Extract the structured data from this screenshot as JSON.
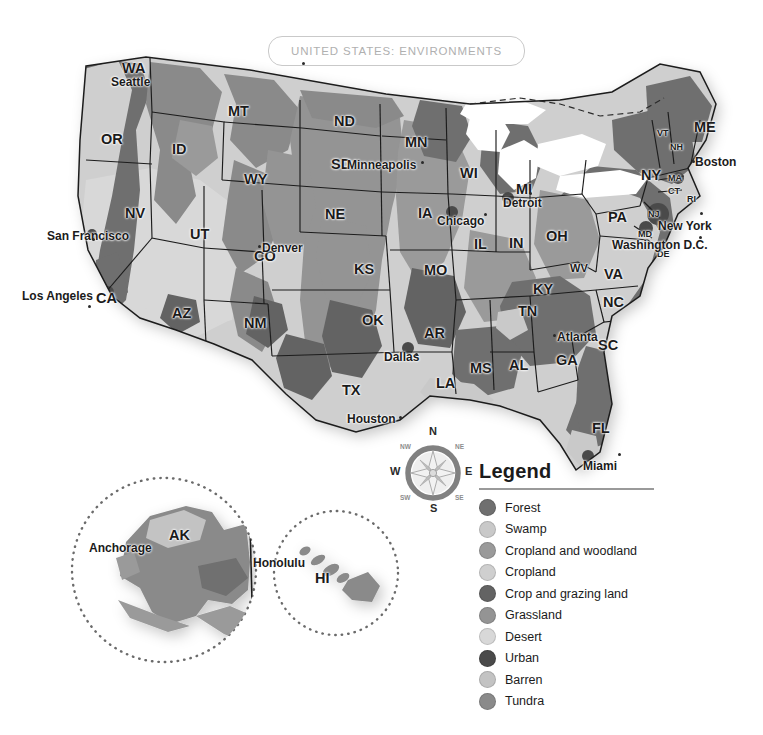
{
  "title": {
    "text": "UNITED STATES: ENVIRONMENTS"
  },
  "legend": {
    "heading": "Legend",
    "items": [
      {
        "label": "Forest",
        "color": "#6f6f6f"
      },
      {
        "label": "Swamp",
        "color": "#c9c9c9"
      },
      {
        "label": "Cropland and woodland",
        "color": "#9a9a9a"
      },
      {
        "label": "Cropland",
        "color": "#cfcfcf"
      },
      {
        "label": "Crop and grazing land",
        "color": "#636363"
      },
      {
        "label": "Grassland",
        "color": "#949494"
      },
      {
        "label": "Desert",
        "color": "#d8d8d8"
      },
      {
        "label": "Urban",
        "color": "#4a4a4a"
      },
      {
        "label": "Barren",
        "color": "#c3c3c3"
      },
      {
        "label": "Tundra",
        "color": "#8a8a8a"
      }
    ]
  },
  "compass": {
    "north": "N",
    "south": "S",
    "east": "E",
    "west": "W",
    "northwest": "NW",
    "northeast": "NE",
    "southwest": "SW",
    "southeast": "SE"
  },
  "insets": {
    "alaska": {
      "state": "AK",
      "city": "Anchorage"
    },
    "hawaii": {
      "state": "HI",
      "city": "Honolulu"
    }
  },
  "map": {
    "states": [
      {
        "abbr": "WA",
        "x": 122,
        "y": 60,
        "size": ""
      },
      {
        "abbr": "OR",
        "x": 101,
        "y": 131,
        "size": ""
      },
      {
        "abbr": "ID",
        "x": 172,
        "y": 141,
        "size": ""
      },
      {
        "abbr": "MT",
        "x": 228,
        "y": 103,
        "size": ""
      },
      {
        "abbr": "WY",
        "x": 244,
        "y": 171,
        "size": ""
      },
      {
        "abbr": "NV",
        "x": 125,
        "y": 205,
        "size": ""
      },
      {
        "abbr": "UT",
        "x": 190,
        "y": 226,
        "size": ""
      },
      {
        "abbr": "CA",
        "x": 96,
        "y": 290,
        "size": ""
      },
      {
        "abbr": "AZ",
        "x": 172,
        "y": 305,
        "size": ""
      },
      {
        "abbr": "CO",
        "x": 254,
        "y": 248,
        "size": ""
      },
      {
        "abbr": "NM",
        "x": 244,
        "y": 315,
        "size": ""
      },
      {
        "abbr": "ND",
        "x": 334,
        "y": 113,
        "size": ""
      },
      {
        "abbr": "SD",
        "x": 331,
        "y": 156,
        "size": ""
      },
      {
        "abbr": "NE",
        "x": 325,
        "y": 206,
        "size": ""
      },
      {
        "abbr": "KS",
        "x": 354,
        "y": 261,
        "size": ""
      },
      {
        "abbr": "OK",
        "x": 362,
        "y": 312,
        "size": ""
      },
      {
        "abbr": "TX",
        "x": 342,
        "y": 382,
        "size": ""
      },
      {
        "abbr": "MN",
        "x": 405,
        "y": 134,
        "size": ""
      },
      {
        "abbr": "IA",
        "x": 418,
        "y": 205,
        "size": ""
      },
      {
        "abbr": "MO",
        "x": 424,
        "y": 262,
        "size": ""
      },
      {
        "abbr": "AR",
        "x": 424,
        "y": 325,
        "size": ""
      },
      {
        "abbr": "LA",
        "x": 436,
        "y": 375,
        "size": ""
      },
      {
        "abbr": "WI",
        "x": 460,
        "y": 165,
        "size": ""
      },
      {
        "abbr": "IL",
        "x": 474,
        "y": 236,
        "size": ""
      },
      {
        "abbr": "IN",
        "x": 509,
        "y": 235,
        "size": ""
      },
      {
        "abbr": "MS",
        "x": 470,
        "y": 360,
        "size": ""
      },
      {
        "abbr": "AL",
        "x": 509,
        "y": 357,
        "size": ""
      },
      {
        "abbr": "MI",
        "x": 516,
        "y": 181,
        "size": ""
      },
      {
        "abbr": "OH",
        "x": 546,
        "y": 228,
        "size": ""
      },
      {
        "abbr": "KY",
        "x": 533,
        "y": 281,
        "size": ""
      },
      {
        "abbr": "TN",
        "x": 518,
        "y": 303,
        "size": ""
      },
      {
        "abbr": "GA",
        "x": 556,
        "y": 352,
        "size": ""
      },
      {
        "abbr": "FL",
        "x": 592,
        "y": 420,
        "size": ""
      },
      {
        "abbr": "SC",
        "x": 598,
        "y": 337,
        "size": ""
      },
      {
        "abbr": "NC",
        "x": 603,
        "y": 294,
        "size": ""
      },
      {
        "abbr": "VA",
        "x": 604,
        "y": 266,
        "size": ""
      },
      {
        "abbr": "WV",
        "x": 570,
        "y": 262,
        "size": "sm"
      },
      {
        "abbr": "PA",
        "x": 608,
        "y": 209,
        "size": ""
      },
      {
        "abbr": "NY",
        "x": 641,
        "y": 167,
        "size": ""
      },
      {
        "abbr": "VT",
        "x": 657,
        "y": 128,
        "size": "xs"
      },
      {
        "abbr": "NH",
        "x": 670,
        "y": 142,
        "size": "xs"
      },
      {
        "abbr": "ME",
        "x": 694,
        "y": 119,
        "size": ""
      },
      {
        "abbr": "MA",
        "x": 668,
        "y": 173,
        "size": "xs"
      },
      {
        "abbr": "CT",
        "x": 668,
        "y": 186,
        "size": "xs"
      },
      {
        "abbr": "RI",
        "x": 687,
        "y": 194,
        "size": "xs"
      },
      {
        "abbr": "NJ",
        "x": 648,
        "y": 209,
        "size": "xs"
      },
      {
        "abbr": "MD",
        "x": 638,
        "y": 229,
        "size": "xs"
      },
      {
        "abbr": "DE",
        "x": 657,
        "y": 249,
        "size": "xs"
      }
    ],
    "cities": [
      {
        "name": "Seattle",
        "x": 111,
        "y": 75,
        "dx": 302,
        "dy": 62,
        "size": ""
      },
      {
        "name": "San Francisco",
        "x": 47,
        "y": 229,
        "dx": 92,
        "dy": 238,
        "size": ""
      },
      {
        "name": "Los Angeles",
        "x": 22,
        "y": 289,
        "dx": 88,
        "dy": 305,
        "size": ""
      },
      {
        "name": "Denver",
        "x": 262,
        "y": 241,
        "dx": 258,
        "dy": 245,
        "size": ""
      },
      {
        "name": "Minneapolis",
        "x": 347,
        "y": 158,
        "dx": 421,
        "dy": 161,
        "size": ""
      },
      {
        "name": "Chicago",
        "x": 437,
        "y": 214,
        "dx": 484,
        "dy": 213,
        "size": ""
      },
      {
        "name": "Detroit",
        "x": 503,
        "y": 196,
        "dx": 529,
        "dy": 192,
        "size": ""
      },
      {
        "name": "Dallas",
        "x": 384,
        "y": 350,
        "dx": 415,
        "dy": 353,
        "size": ""
      },
      {
        "name": "Houston",
        "x": 347,
        "y": 412,
        "dx": 399,
        "dy": 416,
        "size": ""
      },
      {
        "name": "Atlanta",
        "x": 557,
        "y": 330,
        "dx": 553,
        "dy": 334,
        "size": ""
      },
      {
        "name": "Miami",
        "x": 583,
        "y": 459,
        "dx": 618,
        "dy": 453,
        "size": ""
      },
      {
        "name": "Boston",
        "x": 695,
        "y": 155,
        "dx": 692,
        "dy": 160,
        "size": ""
      },
      {
        "name": "New York",
        "x": 658,
        "y": 219,
        "dx": 700,
        "dy": 212,
        "size": ""
      },
      {
        "name": "Washington D.C.",
        "x": 612,
        "y": 238,
        "dx": 699,
        "dy": 236,
        "size": ""
      }
    ]
  }
}
